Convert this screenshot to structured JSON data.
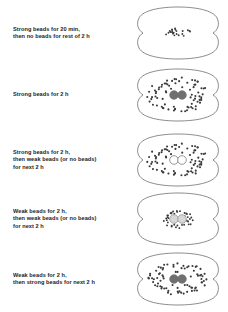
{
  "figure": {
    "type": "scientific-schematic",
    "width": 228,
    "height": 312,
    "background_color": "#ffffff",
    "cell_outline_color": "#5a5a5a",
    "bead_color": "#3a3a3a",
    "nucleus_dark_color": "#707070",
    "nucleus_light_color": "#d8d8d8",
    "nucleus_empty_color": "#ffffff",
    "nucleus_stroke_color": "#707070"
  },
  "rows": [
    {
      "id": "row-1",
      "label": "Strong beads for 20 min,\nthen no beads for rest of 2 h",
      "label_lines": [
        "Strong beads for 20 min,",
        "then no beads for rest of 2 h"
      ],
      "top": 4,
      "cell": {
        "nuclei_visible": false,
        "nucleus_style": "none",
        "bead_pattern": "tight-central-cluster",
        "bead_count": 22,
        "bead_spread_x": 13,
        "bead_spread_y": 5,
        "bead_radius": 0.95
      }
    },
    {
      "id": "row-2",
      "label": "Strong beads for 2 h",
      "label_lines": [
        "Strong beads for 2 h"
      ],
      "top": 66,
      "cell": {
        "nuclei_visible": true,
        "nucleus_style": "dark",
        "bead_pattern": "wide-ring",
        "bead_count": 66,
        "bead_spread_x": 30,
        "bead_spread_y": 17,
        "bead_radius": 1.05
      }
    },
    {
      "id": "row-3",
      "label": "Strong beads for 2 h,\nthen weak beads (or no beads)\nfor next 2 h",
      "label_lines": [
        "Strong beads for 2 h,",
        "then weak beads (or no beads)",
        "for next 2 h"
      ],
      "top": 131,
      "cell": {
        "nuclei_visible": true,
        "nucleus_style": "empty",
        "bead_pattern": "wide-ring",
        "bead_count": 66,
        "bead_spread_x": 30,
        "bead_spread_y": 16,
        "bead_radius": 1.05
      }
    },
    {
      "id": "row-4",
      "label": "Weak beads for 2 h,\nthen weak beads (or no beads)\nfor next 2 h",
      "label_lines": [
        "Weak beads for 2 h,",
        "then weak beads (or no beads)",
        "for next 2 h"
      ],
      "top": 190,
      "cell": {
        "nuclei_visible": true,
        "nucleus_style": "light",
        "bead_pattern": "narrow-ring",
        "bead_count": 34,
        "bead_spread_x": 15,
        "bead_spread_y": 9,
        "bead_radius": 0.95
      }
    },
    {
      "id": "row-5",
      "label": "Weak beads for 2 h,\nthen strong beads for next 2 h",
      "label_lines": [
        "Weak beads for 2 h,",
        "then strong beads for next 2 h"
      ],
      "top": 250,
      "cell": {
        "nuclei_visible": true,
        "nucleus_style": "dark",
        "bead_pattern": "wide-ring",
        "bead_count": 66,
        "bead_spread_x": 29,
        "bead_spread_y": 16,
        "bead_radius": 1.05
      }
    }
  ]
}
